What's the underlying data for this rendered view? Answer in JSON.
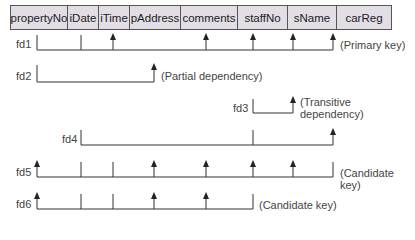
{
  "table": {
    "columns": [
      {
        "name": "propertyNo",
        "width": 57
      },
      {
        "name": "iDate",
        "width": 31
      },
      {
        "name": "iTime",
        "width": 31
      },
      {
        "name": "pAddress",
        "width": 51
      },
      {
        "name": "comments",
        "width": 57
      },
      {
        "name": "staffNo",
        "width": 50
      },
      {
        "name": "sName",
        "width": 49
      },
      {
        "name": "carReg",
        "width": 54
      }
    ]
  },
  "dependencies": [
    {
      "id": "fd1",
      "label": "fd1",
      "note": "(Primary key)"
    },
    {
      "id": "fd2",
      "label": "fd2",
      "note": "(Partial dependency)"
    },
    {
      "id": "fd3",
      "label": "fd3",
      "note_line1": "(Transitive",
      "note_line2": "dependency)"
    },
    {
      "id": "fd4",
      "label": "fd4",
      "note": ""
    },
    {
      "id": "fd5",
      "label": "fd5",
      "note": "(Candidate key)"
    },
    {
      "id": "fd6",
      "label": "fd6",
      "note": "(Candidate key)"
    }
  ],
  "colors": {
    "header_fill": "#e3dde6",
    "line": "#333333",
    "text": "#444444"
  }
}
